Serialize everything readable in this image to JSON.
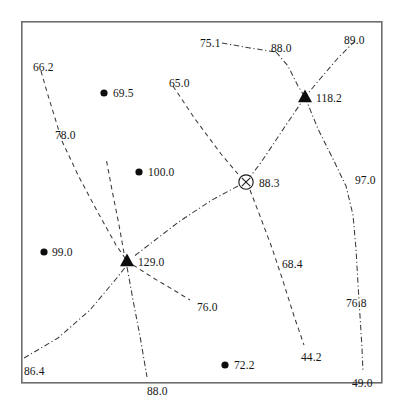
{
  "figure": {
    "title": "",
    "frame": {
      "x": 21,
      "y": 21,
      "w": 361,
      "h": 362,
      "border_color": "#6d6d6d"
    }
  },
  "chart_data": {
    "type": "scatter",
    "title": "",
    "xlabel": "",
    "ylabel": "",
    "xlim": [
      21,
      382
    ],
    "ylim": [
      21,
      383
    ],
    "grid": false,
    "legend": "none",
    "node_symbols": {
      "dot": "filled-circle",
      "triangle": "filled-triangle",
      "circle_x": "circle-with-x"
    },
    "nodes": [
      {
        "id": "n1",
        "symbol": "dot",
        "label": "69.5",
        "value": 69.5,
        "x": 104,
        "y": 93,
        "label_dx": 9,
        "label_dy": -5
      },
      {
        "id": "n2",
        "symbol": "dot",
        "label": "100.0",
        "value": 100.0,
        "x": 139,
        "y": 172,
        "label_dx": 9,
        "label_dy": -5
      },
      {
        "id": "n3",
        "symbol": "dot",
        "label": "99.0",
        "value": 99.0,
        "x": 44,
        "y": 252,
        "label_dx": 8,
        "label_dy": -5
      },
      {
        "id": "n4",
        "symbol": "dot",
        "label": "72.2",
        "value": 72.2,
        "x": 225,
        "y": 365,
        "label_dx": 9,
        "label_dy": -5
      },
      {
        "id": "n5",
        "symbol": "triangle",
        "label": "118.2",
        "value": 118.2,
        "x": 305,
        "y": 97,
        "label_dx": 11,
        "label_dy": -4
      },
      {
        "id": "n6",
        "symbol": "triangle",
        "label": "129.0",
        "value": 129.0,
        "x": 127,
        "y": 261,
        "label_dx": 11,
        "label_dy": -4
      },
      {
        "id": "n7",
        "symbol": "circle_x",
        "label": "88.3",
        "value": 88.3,
        "x": 246,
        "y": 182,
        "label_dx": 13,
        "label_dy": -4
      }
    ],
    "edge_labels": [
      {
        "label": "66.2",
        "value": 66.2,
        "x": 33,
        "y": 62,
        "style": "dashed"
      },
      {
        "label": "78.0",
        "value": 78.0,
        "x": 55,
        "y": 130,
        "style": "dashed"
      },
      {
        "label": "86.4",
        "value": 86.4,
        "x": 24,
        "y": 366,
        "style": "dashdot"
      },
      {
        "label": "88.0",
        "value": 88.0,
        "x": 147,
        "y": 386,
        "style": "dashdot"
      },
      {
        "label": "65.0",
        "value": 65.0,
        "x": 169,
        "y": 78,
        "style": "dashed"
      },
      {
        "label": "75.1",
        "value": 75.1,
        "x": 200,
        "y": 38,
        "style": "dashdot"
      },
      {
        "label": "88.0",
        "value": 88.0,
        "x": 271,
        "y": 43,
        "style": "dashdot"
      },
      {
        "label": "89.0",
        "value": 89.0,
        "x": 344,
        "y": 35,
        "style": "dashdot"
      },
      {
        "label": "97.0",
        "value": 97.0,
        "x": 355,
        "y": 175,
        "style": "dashdot"
      },
      {
        "label": "76.8",
        "value": 76.8,
        "x": 346,
        "y": 298,
        "style": "dashdot"
      },
      {
        "label": "49.0",
        "value": 49.0,
        "x": 352,
        "y": 378,
        "style": "dashdot"
      },
      {
        "label": "68.4",
        "value": 68.4,
        "x": 282,
        "y": 259,
        "style": "dashed"
      },
      {
        "label": "44.2",
        "value": 44.2,
        "x": 301,
        "y": 352,
        "style": "dashed"
      },
      {
        "label": "76.0",
        "value": 76.0,
        "x": 197,
        "y": 302,
        "style": "dashed"
      }
    ],
    "edges": [
      {
        "from": "66.2",
        "to": "78.0-129.0",
        "style": "dashed",
        "points": "41,71 47,92 55,118 62,141 78,175 96,209 116,245 127,261"
      },
      {
        "from": "65.0",
        "to": "88.3",
        "style": "dashed",
        "points": "173,86 195,119 221,154 238,174"
      },
      {
        "from": "75.1",
        "to": "88.0-top",
        "style": "dashdot",
        "points": "222,43 250,48 276,52"
      },
      {
        "from": "88.0-top",
        "to": "118.2",
        "style": "dashdot",
        "points": "276,52 288,66 298,86 305,97"
      },
      {
        "from": "89.0",
        "to": "118.2",
        "style": "dashdot",
        "points": "355,41 338,58 320,79 305,97"
      },
      {
        "from": "118.2",
        "to": "88.3",
        "style": "dashdot",
        "points": "305,97 286,125 262,161 250,177"
      },
      {
        "from": "118.2",
        "to": "97.0",
        "style": "dashdot",
        "points": "305,97 318,129 334,161 346,186 353,215 356,249 358,284 360,316 362,348 363,372"
      },
      {
        "from": "88.3",
        "to": "68.4-44.2",
        "style": "dashed",
        "points": "250,190 260,216 272,248 283,281 294,316 304,345"
      },
      {
        "from": "88.3",
        "to": "129.0",
        "style": "dashdot",
        "points": "238,186 212,200 180,221 150,244 133,257"
      },
      {
        "from": "86.4",
        "to": "129.0",
        "style": "dashdot",
        "points": "24,358 58,338 90,310 116,279 127,265"
      },
      {
        "from": "129.0",
        "to": "88.0-bottom",
        "style": "dashdot",
        "points": "127,267 133,300 140,336 147,377"
      },
      {
        "from": "129.0",
        "to": "76.0",
        "style": "dashed",
        "points": "133,265 155,279 172,289 190,300"
      },
      {
        "from": "129.0",
        "to": "65.0-up",
        "style": "dashed",
        "points": "124,253 119,225 112,190 106,158"
      }
    ]
  }
}
